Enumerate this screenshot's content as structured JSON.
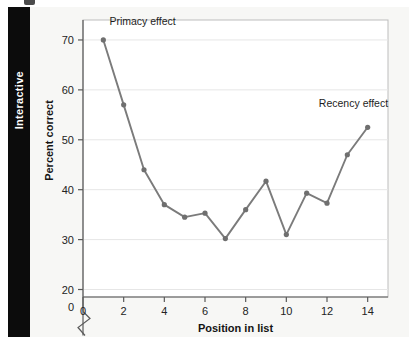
{
  "sidebar": {
    "tab_label": "Interactive"
  },
  "chart_data": {
    "type": "line",
    "title": "",
    "xlabel": "Position in list",
    "ylabel": "Percent correct",
    "x": [
      1,
      2,
      3,
      4,
      5,
      6,
      7,
      8,
      9,
      10,
      11,
      12,
      13,
      14
    ],
    "values": [
      70,
      57,
      44,
      37,
      34.5,
      35.3,
      30.2,
      36,
      41.7,
      31,
      39.3,
      37.3,
      47,
      52.5
    ],
    "series": [
      {
        "name": "Percent correct",
        "values": [
          70,
          57,
          44,
          37,
          34.5,
          35.3,
          30.2,
          36,
          41.7,
          31,
          39.3,
          37.3,
          47,
          52.5
        ]
      }
    ],
    "xticks": [
      "0",
      "2",
      "4",
      "6",
      "8",
      "10",
      "12",
      "14"
    ],
    "xtick_values": [
      0,
      2,
      4,
      6,
      8,
      10,
      12,
      14
    ],
    "yticks": [
      "20",
      "30",
      "40",
      "50",
      "60",
      "70"
    ],
    "ytick_values": [
      20,
      30,
      40,
      50,
      60,
      70
    ],
    "xlim": [
      0,
      15
    ],
    "ylim": [
      20,
      74
    ],
    "y_axis_break": true,
    "y_axis_break_label": "0",
    "grid": "horizontal",
    "legend": "none",
    "line_color": "#7b7b7b",
    "marker_color": "#6f6f6f",
    "annotations": [
      {
        "text": "Primacy effect",
        "x": 1.3,
        "y": 73
      },
      {
        "text": "Recency effect",
        "x": 11.6,
        "y": 56.5
      }
    ]
  },
  "colors": {
    "tab_background": "#0c0c0c",
    "tab_text": "#ffffff",
    "panel_background": "#f7f7f5",
    "plot_background": "#ffffff",
    "line": "#7b7b7b",
    "axis": "#5a5a5a",
    "grid": "#e6e6e6",
    "text": "#1d1d1d"
  }
}
